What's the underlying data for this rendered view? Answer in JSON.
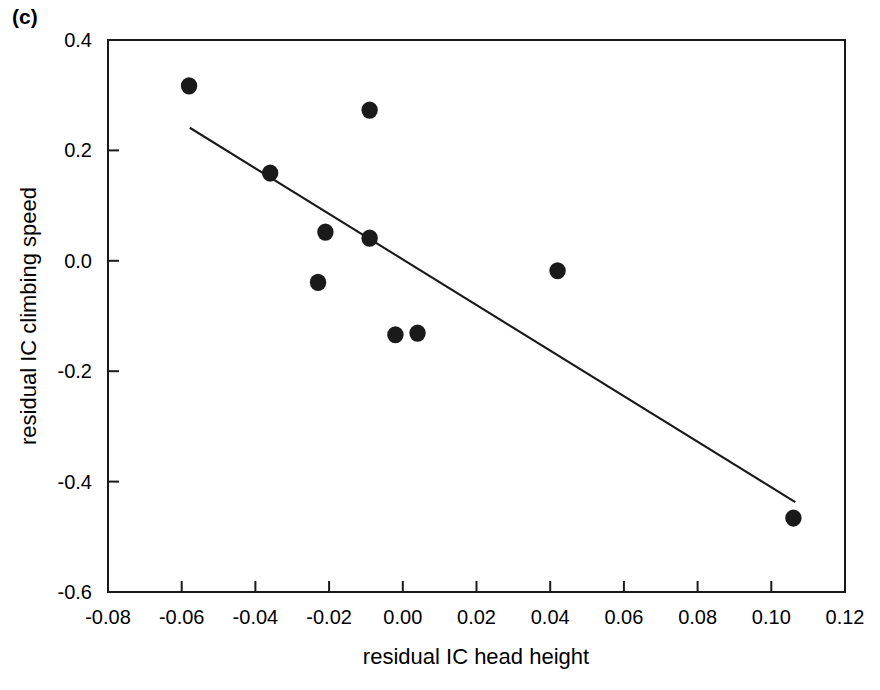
{
  "figure": {
    "panel_label": "(c)"
  },
  "chart_data": {
    "type": "scatter",
    "title": "",
    "xlabel": "residual IC head height",
    "ylabel": "residual IC climbing speed",
    "xlim": [
      -0.08,
      0.12
    ],
    "ylim": [
      -0.6,
      0.4
    ],
    "xticks": [
      -0.08,
      -0.06,
      -0.04,
      -0.02,
      0.0,
      0.02,
      0.04,
      0.06,
      0.08,
      0.1,
      0.12
    ],
    "xticklabels": [
      "-0.08",
      "-0.06",
      "-0.04",
      "-0.02",
      "0.00",
      "0.02",
      "0.04",
      "0.06",
      "0.08",
      "0.10",
      "0.12"
    ],
    "yticks": [
      0.4,
      0.2,
      0.0,
      -0.2,
      -0.4,
      -0.6
    ],
    "yticklabels": [
      "0.4",
      "0.2",
      "0.0",
      "-0.2",
      "-0.4",
      "-0.6"
    ],
    "grid": false,
    "legend": null,
    "marker": "filled-circle",
    "marker_color": "#1a1a1a",
    "points": [
      {
        "x": -0.058,
        "y": 0.317
      },
      {
        "x": -0.036,
        "y": 0.159
      },
      {
        "x": -0.023,
        "y": -0.039
      },
      {
        "x": -0.021,
        "y": 0.052
      },
      {
        "x": -0.009,
        "y": 0.273
      },
      {
        "x": -0.009,
        "y": 0.041
      },
      {
        "x": -0.002,
        "y": -0.134
      },
      {
        "x": 0.004,
        "y": -0.131
      },
      {
        "x": 0.042,
        "y": -0.018
      },
      {
        "x": 0.106,
        "y": -0.466
      }
    ],
    "trendline": {
      "type": "linear-fit",
      "color": "#1a1a1a",
      "x_start": -0.0578,
      "y_start": 0.241,
      "x_end": 0.1065,
      "y_end": -0.437
    }
  }
}
